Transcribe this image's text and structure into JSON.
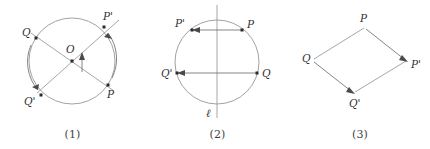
{
  "document": {
    "kind": "geometry-figure-set",
    "background_color": "#ffffff",
    "ink_color": "#3a3a3a",
    "line_color": "#8a8a8a",
    "figure_count": 3
  },
  "figures": [
    {
      "id": "figure-1",
      "caption": "(1)",
      "transformation": "rotation",
      "shape": "circle",
      "circle": {
        "cx": 72,
        "cy": 61,
        "r": 43
      },
      "center_point": {
        "label": "O",
        "x": 72,
        "y": 61
      },
      "labels": {
        "center": "O",
        "p": "P",
        "p_prime": "P'",
        "q": "Q",
        "q_prime": "Q'"
      },
      "points": [
        {
          "name": "P",
          "x": 108,
          "y": 85
        },
        {
          "name": "P'",
          "x": 104,
          "y": 27
        },
        {
          "name": "Q",
          "x": 36,
          "y": 38
        },
        {
          "name": "Q'",
          "x": 41,
          "y": 95
        }
      ],
      "chords": [
        {
          "from": "P",
          "to": "P'"
        },
        {
          "from": "Q",
          "to": "Q'"
        }
      ],
      "arrows": [
        {
          "from": "P",
          "to": "P'",
          "style": "arc"
        },
        {
          "from": "Q",
          "to": "Q'",
          "style": "arc"
        },
        {
          "from": "O",
          "to": "up",
          "style": "rotation-indicator"
        }
      ]
    },
    {
      "id": "figure-2",
      "caption": "(2)",
      "transformation": "reflection",
      "shape": "circle",
      "circle": {
        "cx": 72,
        "cy": 62,
        "r": 42
      },
      "axis": {
        "label": "ℓ",
        "orientation": "vertical",
        "x": 72,
        "y_top": 6,
        "y_bottom": 118
      },
      "labels": {
        "axis": "ℓ",
        "p": "P",
        "p_prime": "P'",
        "q": "Q",
        "q_prime": "Q'"
      },
      "points": [
        {
          "name": "P",
          "x": 97,
          "y": 30
        },
        {
          "name": "P'",
          "x": 47,
          "y": 30
        },
        {
          "name": "Q",
          "x": 112,
          "y": 73
        },
        {
          "name": "Q'",
          "x": 32,
          "y": 73
        }
      ],
      "arrows": [
        {
          "from": "P",
          "to": "P'",
          "style": "straight"
        },
        {
          "from": "Q",
          "to": "Q'",
          "style": "straight"
        }
      ]
    },
    {
      "id": "figure-3",
      "caption": "(3)",
      "transformation": "translation",
      "shape": "parallelogram",
      "labels": {
        "p": "P",
        "p_prime": "P'",
        "q": "Q",
        "q_prime": "Q'"
      },
      "points": [
        {
          "name": "P",
          "x": 75,
          "y": 27
        },
        {
          "name": "P'",
          "x": 117,
          "y": 61
        },
        {
          "name": "Q",
          "x": 22,
          "y": 60
        },
        {
          "name": "Q'",
          "x": 63,
          "y": 94
        }
      ],
      "arrows": [
        {
          "from": "P",
          "to": "P'",
          "style": "straight"
        },
        {
          "from": "Q",
          "to": "Q'",
          "style": "straight"
        }
      ],
      "sides": [
        {
          "from": "Q",
          "to": "P"
        },
        {
          "from": "Q'",
          "to": "P'"
        }
      ]
    }
  ]
}
